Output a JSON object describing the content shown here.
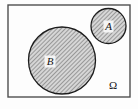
{
  "figure": {
    "type": "venn-diagram",
    "width": 138,
    "height": 109,
    "background_color": "#fdfdfd"
  },
  "universe": {
    "name": "universal-set",
    "label": "Ω",
    "label_x": 113,
    "label_y": 89,
    "rect": {
      "x": 8,
      "y": 5,
      "width": 122,
      "height": 92
    },
    "border_color": "#4f4f4f",
    "border_width": 1.4,
    "fill_color": "#fdfdfd"
  },
  "sets": [
    {
      "name": "set-a",
      "label": "A",
      "cx": 108.5,
      "cy": 26.0,
      "r": 17.5,
      "label_x": 108.5,
      "label_y": 30.0,
      "stroke_color": "#1c1c1c",
      "stroke_width": 1.3,
      "fill_color": "#c9c9c9",
      "hatch": "diagonal-45"
    },
    {
      "name": "set-b",
      "label": "B",
      "cx": 62.0,
      "cy": 60.5,
      "r": 33.5,
      "label_x": 50.0,
      "label_y": 65.0,
      "stroke_color": "#1c1c1c",
      "stroke_width": 1.3,
      "fill_color": "#c9c9c9",
      "hatch": "diagonal-45"
    }
  ],
  "colors": {
    "hatch_line": "#6e6e6e",
    "hatch_base": "#d6d6d6",
    "ink": "#141414",
    "frame": "#4f4f4f"
  }
}
